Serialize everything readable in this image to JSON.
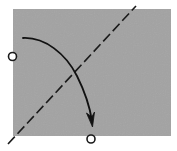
{
  "diagram": {
    "paper": {
      "description": "square sheet of paper (gray side up)",
      "color": "#a3a3a3"
    },
    "fold_line": {
      "type": "valley-fold",
      "style": "dashed",
      "color": "#1a1a1a"
    },
    "fold_arrow": {
      "description": "fold direction arrow from top-left region toward bottom",
      "color": "#111111"
    },
    "reference_points": [
      {
        "id": "point-left-edge",
        "description": "circle marker on left edge"
      },
      {
        "id": "point-bottom-edge",
        "description": "circle marker on bottom edge"
      }
    ],
    "instruction": "Fold so that the left-edge circle meets the bottom-edge circle"
  }
}
